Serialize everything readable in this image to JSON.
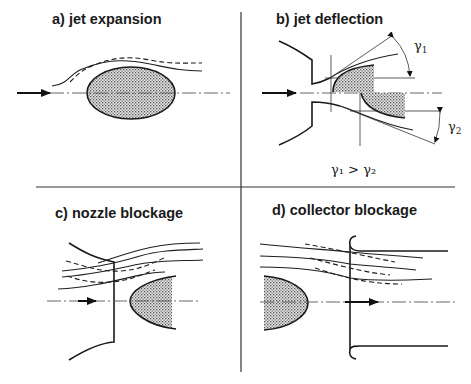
{
  "panels": [
    {
      "id": "a",
      "title": "a) jet expansion"
    },
    {
      "id": "b",
      "title": "b) jet deflection",
      "annotations": {
        "angle1": "γ",
        "angle1_sub": "1",
        "angle2": "γ",
        "angle2_sub": "2",
        "relation": "γ₁ > γ₂"
      }
    },
    {
      "id": "c",
      "title": "c) nozzle blockage"
    },
    {
      "id": "d",
      "title": "d) collector blockage"
    }
  ],
  "colors": {
    "line": "#1e1e1e",
    "fill_stipple": "#b5b5b5",
    "background": "#ffffff"
  }
}
